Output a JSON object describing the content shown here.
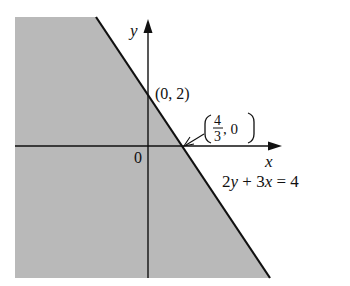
{
  "figure": {
    "type": "linear-inequality-graph",
    "axes": {
      "x_label": "x",
      "y_label": "y",
      "origin_label": "0"
    },
    "boundary_line": {
      "equation": "2y + 3x = 4",
      "style": "solid"
    },
    "points": [
      {
        "label": "(0, 2)",
        "x": 0,
        "y": 2
      },
      {
        "label_num": "4",
        "label_den": "3",
        "label_rest": ", 0",
        "x": 1.333,
        "y": 0
      }
    ],
    "shaded_region": "below-left of line (2y + 3x ≤ 4)",
    "colors": {
      "shade": "#b8b8b8",
      "line": "#111111",
      "background": "#ffffff"
    }
  }
}
